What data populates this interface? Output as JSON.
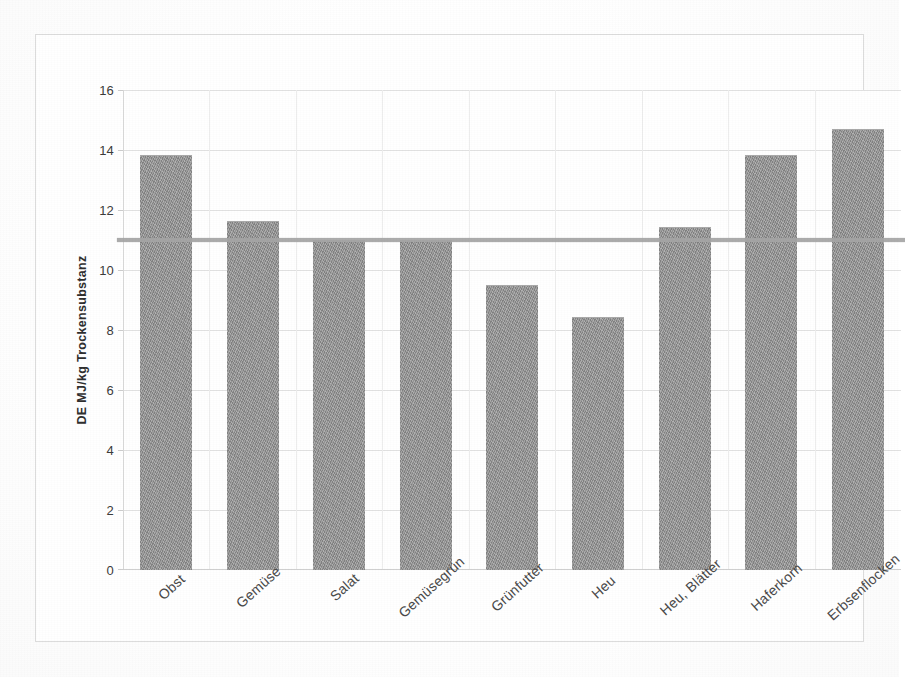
{
  "chart_data": {
    "type": "bar",
    "title": "",
    "xlabel": "",
    "ylabel": "DE MJ/kg Trockensubstanz",
    "categories": [
      "Obst",
      "Gemüse",
      "Salat",
      "Gemüsegrün",
      "Grünfutter",
      "Heu",
      "Heu, Blätter",
      "Haferkorn",
      "Erbsenflocken"
    ],
    "values": [
      13.85,
      11.65,
      11.0,
      11.0,
      9.5,
      8.45,
      11.45,
      13.85,
      14.7
    ],
    "ylim": [
      0,
      16
    ],
    "ytick_labels": [
      "0",
      "2",
      "4",
      "6",
      "8",
      "10",
      "12",
      "14",
      "16"
    ],
    "ytick_values": [
      0,
      2,
      4,
      6,
      8,
      10,
      12,
      14,
      16
    ],
    "grid": true,
    "legend": "none",
    "reference_line": {
      "value": 11.0,
      "label": "",
      "color": "#a6a6a6"
    },
    "bar_color": "#8d8d8d",
    "gridline_color": "#e2e2e2",
    "axis_text_color": "#3c3c3c",
    "background_color": "#ffffff",
    "frame_color": "#dcdcdc"
  }
}
